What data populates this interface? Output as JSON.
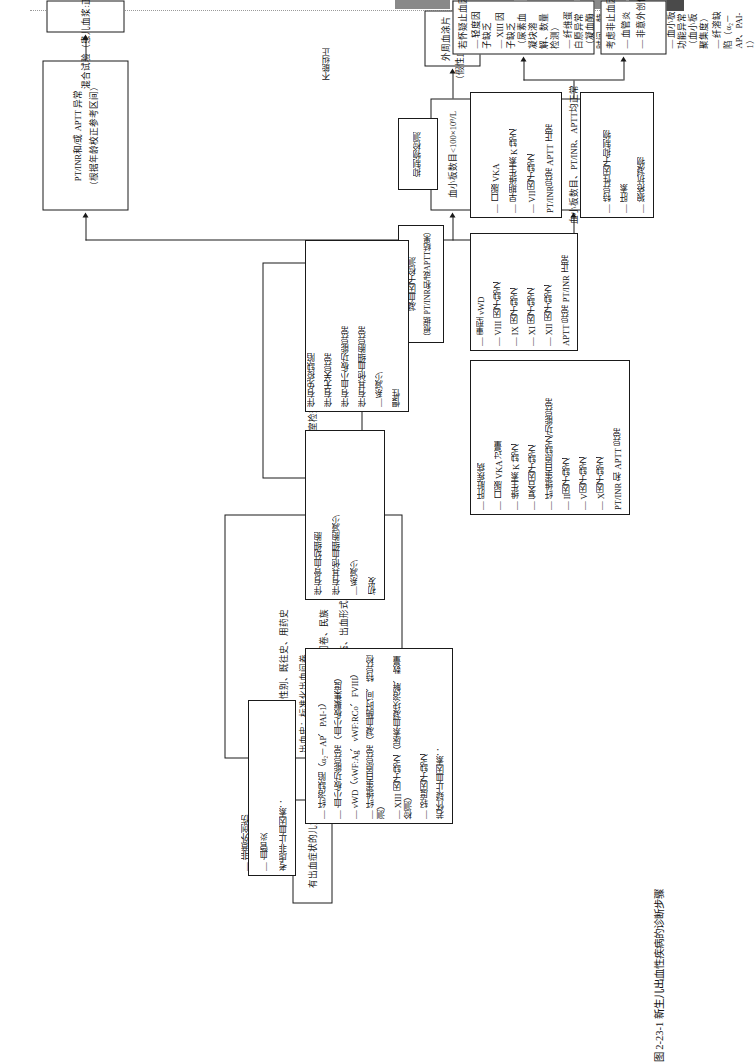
{
  "figure": {
    "caption": "图 2-23-1  新生儿出血性疾病的诊断步骤"
  },
  "nodes": {
    "start": {
      "text": "有出血症状的儿童"
    },
    "history": {
      "lines": [
        "病史：年龄、性别、既往史、用药史",
        "出血史：标准化出血问卷",
        "家族出血史：标准化出血问卷、民族",
        "体格检查：血流动力学状态、出血形式、其他表现"
      ]
    },
    "initial_lab": {
      "text": "首要实验室检查：全血细胞计数、PT/INR、APTT"
    },
    "platelet_low": {
      "text": "血小板数目<100×10⁹/L"
    },
    "smear": {
      "lines": [
        "外周血涂片",
        "（假性血小板减少症）"
      ]
    },
    "acute": {
      "title": "初发",
      "items": [
        "—系减少",
        "伴有其他血细胞减少",
        "伴有骨血幼细胞"
      ]
    },
    "chronic": {
      "title": "慢性",
      "items": [
        "—系减少",
        "伴有其他血细胞异常",
        "伴有血小板功能异常",
        "伴有无关异常",
        "伴有免疫缺陷"
      ]
    },
    "coag_normal": {
      "text": "血小板数目、PT/INR、APTT均正常"
    },
    "nonhemostatic": {
      "title": "考虑非止血因素：",
      "items": [
        "— 血管炎",
        "— 非意外创伤"
      ]
    },
    "hemostatic": {
      "title": "若怀疑止血因素：",
      "items": [
        "— 轻度因子缺乏",
        "— XIII 因子缺乏（尿素血凝块溶解、数量检测）",
        "— 纤维蛋白原异常（凝血酶时间、特异检测）",
        "— vWD（vWF:Ag、vWF:RCo、FVIII）",
        "— 血小板功能异常（血小板聚集度）",
        "— 纤溶缺陷（α₂－AP、PAI-1）"
      ]
    },
    "pt_aptt_abn": {
      "lines": [
        "PT/INR和/或 APTT 异常",
        "（根据年龄校正参考区间）"
      ]
    },
    "mixing": {
      "text": "混合试验（患儿血浆:正常血浆=1:1）"
    },
    "inhibitor": {
      "text": "抑制物检测"
    },
    "factor_assay": {
      "lines": [
        "凝血因子检测",
        "（根据 PT/INR和/或APTT结果）"
      ]
    },
    "inhibitor_results": {
      "items": [
        "— 狼疮抗凝物",
        "— 肝素",
        "— 特异性因子抑制物"
      ]
    },
    "pt_abn_aptt_norm": {
      "title": "PT/INR异常  APTT 正常",
      "items": [
        "— VII因子缺乏",
        "— 早期维生素 K 缺乏",
        "— 口服 VKA"
      ]
    },
    "aptt_abn_pt_norm": {
      "title": "APTT 异常  PT/INR 正常",
      "items": [
        "— XII 因子缺乏",
        "— XI 因子缺乏",
        "— IX 因子缺乏",
        "— VIII 因子缺乏",
        "— 重型 vWD"
      ]
    },
    "both_abn": {
      "title": "PT/INR 和 APTT 异常",
      "items": [
        "— X因子缺乏",
        "— V因子缺乏",
        "— II因子缺乏",
        "— 纤维蛋白原缺乏/功能异常",
        "— 复合因子缺乏",
        "— 维生素 K 缺乏",
        "— 口服 VKA 过量",
        "— 肝脏疾病"
      ]
    }
  },
  "edge_labels": {
    "corrected": "可纠正",
    "not_corrected": "不能纠正"
  }
}
